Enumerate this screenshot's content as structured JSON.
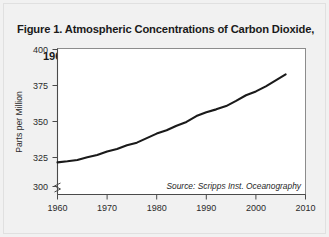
{
  "figure": {
    "title": "Figure 1. Atmospheric Concentrations of Carbon Dioxide,\n          1960–2006",
    "title_line1": "Figure 1. Atmospheric Concentrations of Carbon Dioxide,",
    "title_line2": "1960–2006",
    "background_color": "#f1f1f1",
    "plot_background_color": "#ffffff",
    "line_color": "#1a1a1a"
  },
  "chart_data": {
    "type": "line",
    "title": "Figure 1. Atmospheric Concentrations of Carbon Dioxide, 1960–2006",
    "xlabel": "",
    "ylabel": "Parts per Million",
    "xlim": [
      1960,
      2010
    ],
    "ylim": [
      295,
      400
    ],
    "y_axis_break": true,
    "grid": false,
    "legend": false,
    "source_note": "Source: Scripps Inst. Oceanography",
    "xticks": [
      1960,
      1970,
      1980,
      1990,
      2000,
      2010
    ],
    "xtick_labels": [
      "1960",
      "1970",
      "1980",
      "1990",
      "2000",
      "2010"
    ],
    "yticks": [
      300,
      325,
      350,
      375,
      400
    ],
    "ytick_labels": [
      "300",
      "325",
      "350",
      "375",
      "400"
    ],
    "series": [
      {
        "name": "Atmospheric CO2 concentration",
        "x": [
          1960,
          1962,
          1964,
          1966,
          1968,
          1970,
          1972,
          1974,
          1976,
          1978,
          1980,
          1982,
          1984,
          1986,
          1988,
          1990,
          1992,
          1994,
          1996,
          1998,
          2000,
          2002,
          2004,
          2006
        ],
        "values": [
          317.6,
          318.4,
          319.4,
          321.3,
          323.0,
          325.6,
          327.4,
          330.1,
          332.0,
          335.3,
          338.6,
          341.0,
          344.3,
          347.1,
          351.4,
          354.2,
          356.3,
          358.7,
          362.5,
          366.6,
          369.4,
          373.1,
          377.4,
          381.8
        ]
      }
    ]
  },
  "axis": {
    "y_title": "Parts per Million"
  }
}
